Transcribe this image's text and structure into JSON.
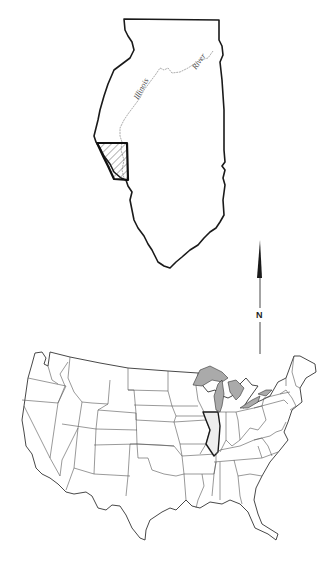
{
  "figure": {
    "type": "locator-map",
    "colors": {
      "background": "#ffffff",
      "outline": "#1a1a1a",
      "state_lines": "#555555",
      "river": "#888888",
      "highlight_fill": "#eeeeee",
      "lakes_fill": "#aaaaaa"
    }
  },
  "illinois_map": {
    "river_label_part1": "Illinois",
    "river_label_part2": "River",
    "study_area": "hatched-region"
  },
  "north_arrow": {
    "label": "N"
  },
  "us_map": {
    "highlighted_state": "Illinois"
  }
}
